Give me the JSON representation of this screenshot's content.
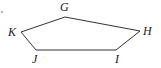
{
  "diagram": {
    "type": "pentagon",
    "stroke_color": "#333333",
    "vertices": [
      {
        "label": "G",
        "x": 65,
        "y": 17,
        "lx": 60,
        "ly": 11
      },
      {
        "label": "H",
        "x": 140,
        "y": 31,
        "lx": 143,
        "ly": 35
      },
      {
        "label": "I",
        "x": 116,
        "y": 50,
        "lx": 115,
        "ly": 63
      },
      {
        "label": "J",
        "x": 36,
        "y": 50,
        "lx": 32,
        "ly": 63
      },
      {
        "label": "K",
        "x": 21,
        "y": 32,
        "lx": 8,
        "ly": 36
      }
    ],
    "marks": [
      {
        "name": "stray-dot",
        "x": 2,
        "y": 12
      }
    ]
  }
}
